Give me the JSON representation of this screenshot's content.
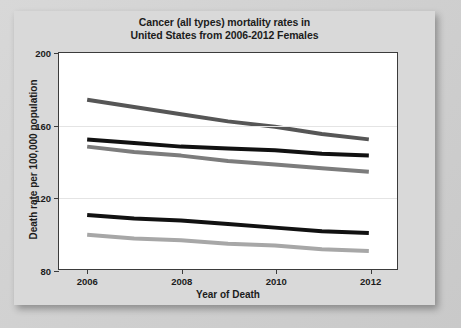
{
  "chart_data": {
    "type": "line",
    "title": "Cancer (all types) mortality rates in United States from 2006-2012 Females",
    "title_lines": [
      "Cancer (all types) mortality rates in",
      "United States from 2006-2012 Females"
    ],
    "xlabel": "Year of Death",
    "ylabel": "Death rate per 100,000 population",
    "x": [
      2006,
      2007,
      2008,
      2009,
      2010,
      2011,
      2012
    ],
    "xlim": [
      2005.4,
      2012.6
    ],
    "ylim": [
      80,
      200
    ],
    "xticks": [
      2006,
      2008,
      2010,
      2012
    ],
    "xtick_labels": [
      "2006",
      "2008",
      "2010",
      "2012"
    ],
    "yticks": [
      80,
      120,
      160,
      200
    ],
    "ytick_labels": [
      "80",
      "120",
      "160",
      "200"
    ],
    "grid": true,
    "legend": "none",
    "series": [
      {
        "name": "series-1-dark-gray",
        "color": "#565656",
        "values": [
          174,
          170,
          166,
          162,
          159,
          155,
          152
        ]
      },
      {
        "name": "series-2-black-upper",
        "color": "#111111",
        "values": [
          152,
          150,
          148,
          147,
          146,
          144,
          143
        ]
      },
      {
        "name": "series-3-mid-gray",
        "color": "#7c7c7c",
        "values": [
          148,
          145,
          143,
          140,
          138,
          136,
          134
        ]
      },
      {
        "name": "series-4-black-lower",
        "color": "#111111",
        "values": [
          110,
          108,
          107,
          105,
          103,
          101,
          100
        ]
      },
      {
        "name": "series-5-light-gray",
        "color": "#a7a7a7",
        "values": [
          99,
          97,
          96,
          94,
          93,
          91,
          90
        ]
      }
    ]
  }
}
